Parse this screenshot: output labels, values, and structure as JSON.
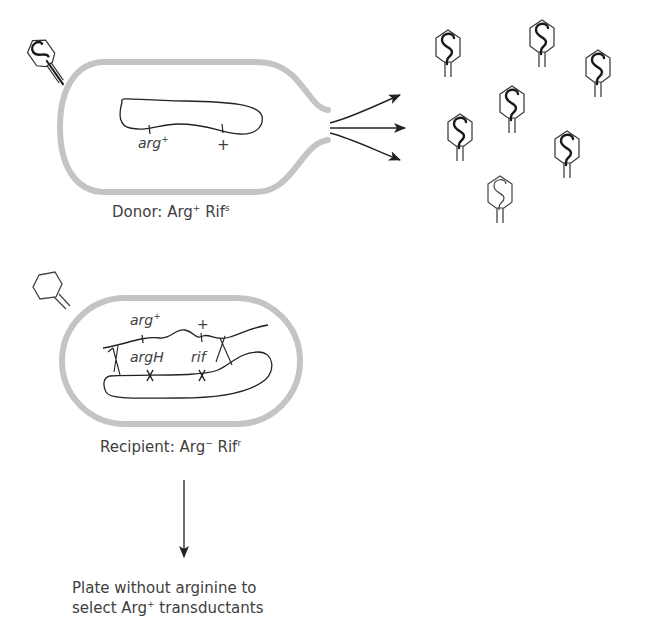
{
  "diagram": {
    "colors": {
      "cell_wall": "#c4c4c4",
      "line": "#2a2a2a",
      "text": "#404040",
      "arrow": "#222222"
    },
    "donor": {
      "label_prefix": "Donor: Arg",
      "label_sup1": "+",
      "label_mid": " Rif",
      "label_sup2": "s",
      "chromosome_markers": [
        {
          "gene": "arg",
          "sup": "+"
        },
        {
          "gene": "+",
          "sup": ""
        }
      ]
    },
    "released_phages": {
      "count": 7,
      "icon": "phage-with-dna-icon"
    },
    "recipient": {
      "label_prefix": "Recipient: Arg",
      "label_sup1": "−",
      "label_mid": " Rif",
      "label_sup2": "r",
      "incoming_fragment_markers": [
        {
          "gene": "arg",
          "sup": "+"
        },
        {
          "gene": "+",
          "sup": ""
        }
      ],
      "chromosome_markers": [
        {
          "gene": "argH"
        },
        {
          "gene": "rif"
        }
      ]
    },
    "selection": {
      "line1": "Plate without arginine to",
      "line2_prefix": "select Arg",
      "line2_sup": "+",
      "line2_suffix": " transductants"
    }
  }
}
